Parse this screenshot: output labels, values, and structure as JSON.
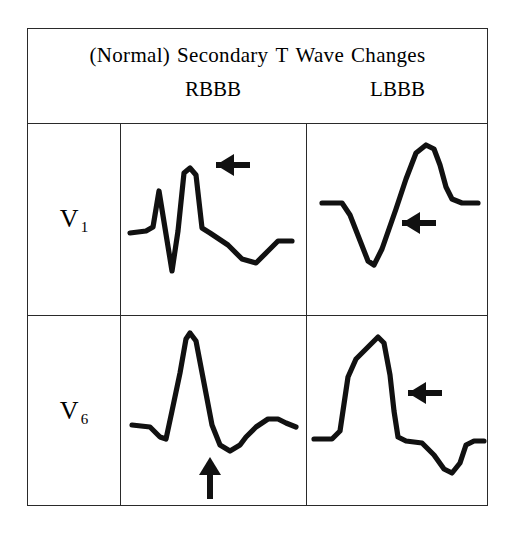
{
  "figure": {
    "title_words": [
      "(Normal)",
      "Secondary",
      "T",
      "Wave",
      "Changes"
    ],
    "title_full": "(Normal) Secondary T Wave Changes",
    "columns": [
      {
        "key": "rbbb",
        "label": "RBBB"
      },
      {
        "key": "lbbb",
        "label": "LBBB"
      }
    ],
    "rows": [
      {
        "key": "v1",
        "lead": "V",
        "subscript": "1"
      },
      {
        "key": "v6",
        "lead": "V",
        "subscript": "6"
      }
    ],
    "colors": {
      "border": "#2a2a2a",
      "trace": "#111111",
      "background": "#ffffff"
    },
    "cells": [
      {
        "row": "v1",
        "column": "rbbb",
        "name": "ecg-v1-rbbb",
        "morphology": "rSR' complex with small r, deep S, tall R-prime and downward-sloping inverted T wave",
        "arrow": {
          "direction": "left",
          "target": "T wave"
        }
      },
      {
        "row": "v1",
        "column": "lbbb",
        "name": "ecg-v1-lbbb",
        "morphology": "wide deep QS complex followed by tall upright T wave",
        "arrow": {
          "direction": "left",
          "target": "T wave"
        }
      },
      {
        "row": "v6",
        "column": "rbbb",
        "name": "ecg-v6-rbbb",
        "morphology": "qR complex with tall R and wide slurred S wave, upright T wave",
        "arrow": {
          "direction": "up",
          "target": "slurred S wave"
        }
      },
      {
        "row": "v6",
        "column": "lbbb",
        "name": "ecg-v6-lbbb",
        "morphology": "broad notched R wave with inverted T wave",
        "arrow": {
          "direction": "left",
          "target": "T wave"
        }
      }
    ]
  }
}
